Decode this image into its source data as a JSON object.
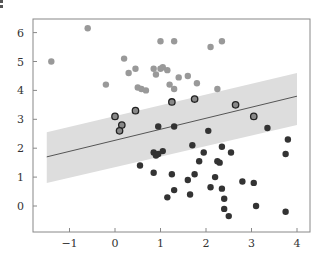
{
  "chart_data": {
    "type": "scatter",
    "title": "",
    "xlabel": "",
    "ylabel": "",
    "xlim": [
      -1.75,
      4.3
    ],
    "ylim": [
      -0.9,
      6.5
    ],
    "x_ticks": [
      -1,
      0,
      1,
      2,
      3,
      4
    ],
    "x_tick_labels": [
      "−1",
      "0",
      "1",
      "2",
      "3",
      "4"
    ],
    "y_ticks": [
      0,
      1,
      2,
      3,
      4,
      5,
      6
    ],
    "y_tick_labels": [
      "0",
      "1",
      "2",
      "3",
      "4",
      "5",
      "6"
    ],
    "grid": false,
    "legend": null,
    "fit_line": {
      "x": [
        -1.5,
        4.0
      ],
      "y": [
        1.7,
        3.8
      ],
      "color": "#555555"
    },
    "margin_band": {
      "x": [
        -1.5,
        4.0
      ],
      "upper": [
        2.55,
        4.6
      ],
      "lower": [
        0.8,
        2.8
      ],
      "color": "#dddddd"
    },
    "series": [
      {
        "name": "class-upper",
        "color": "#999999",
        "edge": null,
        "points": [
          [
            -1.4,
            5.0
          ],
          [
            -0.6,
            6.15
          ],
          [
            -0.2,
            4.2
          ],
          [
            0.2,
            5.1
          ],
          [
            0.45,
            4.75
          ],
          [
            0.5,
            4.1
          ],
          [
            0.58,
            4.05
          ],
          [
            0.68,
            4.0
          ],
          [
            0.9,
            4.55
          ],
          [
            1.0,
            4.75
          ],
          [
            1.05,
            4.8
          ],
          [
            1.15,
            4.7
          ],
          [
            1.2,
            4.2
          ],
          [
            1.4,
            4.45
          ],
          [
            1.6,
            4.5
          ],
          [
            1.8,
            4.25
          ],
          [
            1.3,
            5.7
          ],
          [
            1.3,
            4.05
          ],
          [
            0.85,
            4.75
          ],
          [
            2.1,
            5.5
          ],
          [
            2.35,
            5.7
          ],
          [
            2.25,
            4.05
          ],
          [
            0.3,
            4.6
          ],
          [
            1.0,
            5.7
          ]
        ]
      },
      {
        "name": "support-vectors",
        "color": "#888888",
        "edge": "#222222",
        "points": [
          [
            0.0,
            3.1
          ],
          [
            0.15,
            2.8
          ],
          [
            0.1,
            2.6
          ],
          [
            0.45,
            3.3
          ],
          [
            1.25,
            3.6
          ],
          [
            1.75,
            3.7
          ],
          [
            2.65,
            3.5
          ],
          [
            3.05,
            3.1
          ]
        ]
      },
      {
        "name": "class-lower",
        "color": "#333333",
        "edge": null,
        "points": [
          [
            0.95,
            2.75
          ],
          [
            1.3,
            2.75
          ],
          [
            2.05,
            2.6
          ],
          [
            3.35,
            2.7
          ],
          [
            1.7,
            2.1
          ],
          [
            0.85,
            1.85
          ],
          [
            0.95,
            1.8
          ],
          [
            1.05,
            1.9
          ],
          [
            0.9,
            1.75
          ],
          [
            0.55,
            1.4
          ],
          [
            1.95,
            1.85
          ],
          [
            2.35,
            2.05
          ],
          [
            3.8,
            2.3
          ],
          [
            1.6,
            0.9
          ],
          [
            2.3,
            1.5
          ],
          [
            2.2,
            1.0
          ],
          [
            2.55,
            1.85
          ],
          [
            2.8,
            0.85
          ],
          [
            3.05,
            0.8
          ],
          [
            2.25,
            1.55
          ],
          [
            1.25,
            1.1
          ],
          [
            0.85,
            1.15
          ],
          [
            1.75,
            1.1
          ],
          [
            1.3,
            0.55
          ],
          [
            1.15,
            0.3
          ],
          [
            1.65,
            0.4
          ],
          [
            2.1,
            0.65
          ],
          [
            2.4,
            0.25
          ],
          [
            2.4,
            -0.1
          ],
          [
            2.5,
            -0.35
          ],
          [
            3.1,
            0.0
          ],
          [
            3.75,
            -0.2
          ],
          [
            2.35,
            0.6
          ],
          [
            3.75,
            1.8
          ],
          [
            1.85,
            1.55
          ]
        ]
      }
    ],
    "colors": {
      "frame": "#888888",
      "tick_text": "#333333",
      "band": "#dddddd",
      "line": "#555555"
    }
  }
}
